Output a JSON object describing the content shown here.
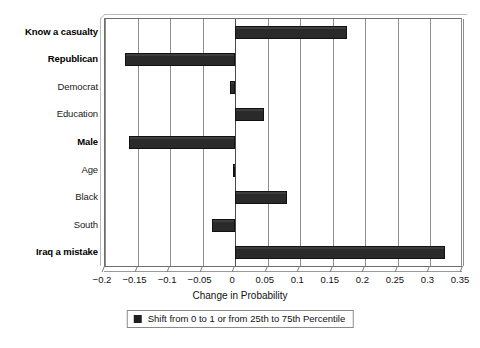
{
  "chart_data": {
    "type": "bar",
    "orientation": "horizontal",
    "title": "",
    "xlabel": "Change in Probability",
    "ylabel": "",
    "xlim": [
      -0.2,
      0.35
    ],
    "xticks": [
      -0.2,
      -0.15,
      -0.1,
      -0.05,
      0,
      0.05,
      0.1,
      0.15,
      0.2,
      0.25,
      0.3,
      0.35
    ],
    "xticklabels": [
      "−0.2",
      "−0.15",
      "−0.1",
      "−0.05",
      "0",
      "0.05",
      "0.1",
      "0.15",
      "0.2",
      "0.25",
      "0.3",
      "0.35"
    ],
    "grid": "vertical",
    "legend_position": "bottom",
    "legend": [
      "Shift from 0 to 1 or from 25th to 75th Percentile"
    ],
    "bar_color": "#2a2a2a",
    "categories": [
      "Know a casualty",
      "Republican",
      "Democrat",
      "Education",
      "Male",
      "Age",
      "Black",
      "South",
      "Iraq a mistake"
    ],
    "emphasis": [
      true,
      true,
      false,
      false,
      true,
      false,
      false,
      false,
      true
    ],
    "values": [
      0.172,
      -0.17,
      -0.008,
      0.045,
      -0.163,
      -0.004,
      0.079,
      -0.035,
      0.323
    ]
  },
  "axis": {
    "xtitle": "Change in Probability"
  },
  "legend": {
    "label": "Shift from 0 to 1 or from 25th to 75th Percentile",
    "swatch_color": "#1f1f1f"
  }
}
